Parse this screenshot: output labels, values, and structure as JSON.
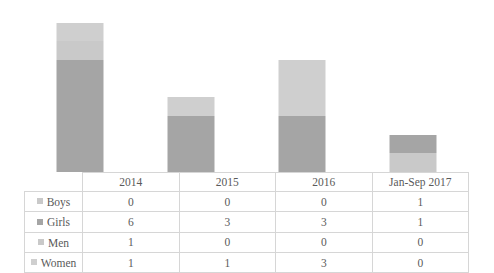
{
  "chart_data": {
    "type": "bar",
    "subtype": "stacked-column",
    "title": "",
    "xlabel": "",
    "ylabel": "",
    "grid": false,
    "legend_position": "table-row-headers",
    "axis_visible": false,
    "value_labels_shown": false,
    "categories": [
      "2014",
      "2015",
      "2016",
      "Jan-Sep 2017"
    ],
    "series": [
      {
        "name": "Boys",
        "values": [
          0,
          0,
          0,
          1
        ],
        "color": "#c9c9c9"
      },
      {
        "name": "Girls",
        "values": [
          6,
          3,
          3,
          1
        ],
        "color": "#a5a5a5"
      },
      {
        "name": "Men",
        "values": [
          1,
          0,
          0,
          0
        ],
        "color": "#c9c9c9"
      },
      {
        "name": "Women",
        "values": [
          1,
          1,
          3,
          0
        ],
        "color": "#cfcfcf"
      }
    ],
    "totals": [
      8,
      4,
      6,
      2
    ],
    "ylim": [
      0,
      9
    ]
  },
  "table": {
    "corner_label": "",
    "column_headers": [
      "2014",
      "2015",
      "2016",
      "Jan-Sep 2017"
    ],
    "rows": [
      {
        "label": "Boys",
        "swatch_color": "#c9c9c9",
        "values": [
          "0",
          "0",
          "0",
          "1"
        ]
      },
      {
        "label": "Girls",
        "swatch_color": "#a5a5a5",
        "values": [
          "6",
          "3",
          "3",
          "1"
        ]
      },
      {
        "label": "Men",
        "swatch_color": "#c9c9c9",
        "values": [
          "1",
          "0",
          "0",
          "0"
        ]
      },
      {
        "label": "Women",
        "swatch_color": "#cfcfcf",
        "values": [
          "1",
          "1",
          "3",
          "0"
        ]
      }
    ]
  },
  "colors": {
    "boys": "#c9c9c9",
    "girls": "#a5a5a5",
    "men": "#c9c9c9",
    "women": "#cfcfcf",
    "grid_line": "#d6d6d6",
    "text": "#595959",
    "background": "#ffffff"
  }
}
